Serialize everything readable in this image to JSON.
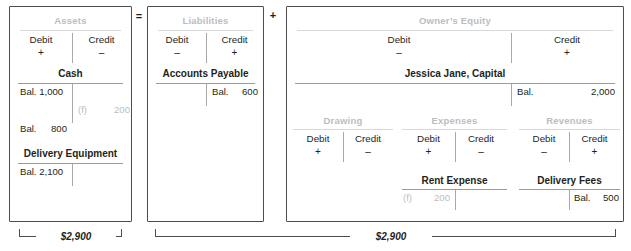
{
  "operators": {
    "equals": "=",
    "plus": "+"
  },
  "colors": {
    "ink": "#231f20",
    "muted_gray": "#bcbdc0",
    "rule_gray": "#d7d8da",
    "border": "#4d4d4f"
  },
  "sections": {
    "assets": {
      "title": "Assets",
      "debit_label": "Debit",
      "debit_sign": "+",
      "credit_label": "Credit",
      "credit_sign": "–",
      "accounts": [
        {
          "name": "Cash",
          "rows": [
            {
              "debit_ref": "",
              "debit_amount": "Bal. 1,000",
              "credit_ref": "",
              "credit_amount": "",
              "faded": false
            },
            {
              "debit_ref": "",
              "debit_amount": "",
              "credit_ref": "(f)",
              "credit_amount": "200",
              "faded": true
            },
            {
              "debit_ref": "",
              "debit_amount": "Bal.",
              "debit_value": "800",
              "credit_ref": "",
              "credit_amount": "",
              "faded": false
            }
          ]
        },
        {
          "name": "Delivery Equipment",
          "rows": [
            {
              "debit_ref": "",
              "debit_amount": "Bal. 2,100",
              "credit_ref": "",
              "credit_amount": "",
              "faded": false
            }
          ]
        }
      ],
      "total": "$2,900"
    },
    "liabilities": {
      "title": "Liabilities",
      "debit_label": "Debit",
      "debit_sign": "–",
      "credit_label": "Credit",
      "credit_sign": "+",
      "accounts": [
        {
          "name": "Accounts Payable",
          "rows": [
            {
              "credit_ref": "Bal.",
              "credit_amount": "600",
              "faded": false
            }
          ]
        }
      ]
    },
    "owners_equity": {
      "title": "Owner’s Equity",
      "debit_label": "Debit",
      "debit_sign": "–",
      "credit_label": "Credit",
      "credit_sign": "+",
      "capital_account": {
        "name": "Jessica Jane, Capital",
        "credit_ref": "Bal.",
        "credit_amount": "2,000"
      },
      "sub_accounts": [
        {
          "id": "drawing",
          "title": "Drawing",
          "debit_label": "Debit",
          "debit_sign": "+",
          "credit_label": "Credit",
          "credit_sign": "–",
          "account_name": "",
          "debit_ref": "",
          "debit_amount": "",
          "credit_ref": "",
          "credit_amount": ""
        },
        {
          "id": "expenses",
          "title": "Expenses",
          "debit_label": "Debit",
          "debit_sign": "+",
          "credit_label": "Credit",
          "credit_sign": "–",
          "account_name": "Rent Expense",
          "debit_ref": "(f)",
          "debit_amount": "200",
          "credit_ref": "",
          "credit_amount": "",
          "faded": true
        },
        {
          "id": "revenues",
          "title": "Revenues",
          "debit_label": "Debit",
          "debit_sign": "–",
          "credit_label": "Credit",
          "credit_sign": "+",
          "account_name": "Delivery Fees",
          "debit_ref": "",
          "debit_amount": "",
          "credit_ref": "Bal.",
          "credit_amount": "500",
          "faded": false
        }
      ]
    },
    "right_total": "$2,900"
  }
}
